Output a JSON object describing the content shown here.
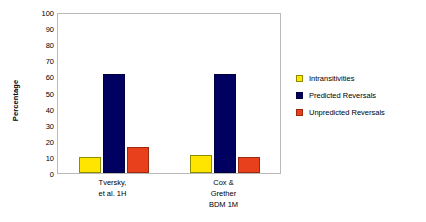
{
  "chart_data": {
    "type": "bar",
    "title": "",
    "xlabel": "",
    "ylabel": "Percentage",
    "ylim": [
      0,
      100
    ],
    "ytick_step": 10,
    "yticks": [
      100,
      90,
      80,
      70,
      60,
      50,
      40,
      30,
      20,
      10,
      0
    ],
    "grid": false,
    "legend_position": "right",
    "categories": [
      "Tversky, et al. 1H",
      "Cox & Grether BDM 1M"
    ],
    "category_lines": [
      [
        "Tversky,",
        "et al. 1H"
      ],
      [
        "Cox &",
        "Grether",
        "BDM 1M"
      ]
    ],
    "series": [
      {
        "name": "Intransitivities",
        "color": "#FFE500",
        "border_color": "#8C8C00",
        "values": [
          10,
          11
        ]
      },
      {
        "name": "Predicted Reversals",
        "color": "#000060",
        "border_color": "#000040",
        "values": [
          62,
          62
        ]
      },
      {
        "name": "Unpredicted Reversals",
        "color": "#E8401C",
        "border_color": "#A02810",
        "values": [
          16,
          10
        ]
      }
    ]
  },
  "plot": {
    "border_color": "#b9b9b9",
    "background": "#ffffff"
  }
}
